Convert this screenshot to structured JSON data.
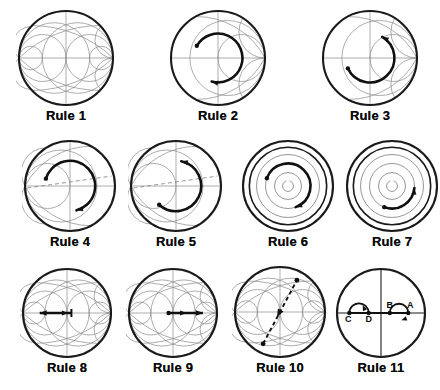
{
  "figure": {
    "background_color": "#ffffff",
    "grid_color": "#8a8a8a",
    "outline_color": "#1a1a1a",
    "arrow_color": "#101010",
    "label_color": "#0a0a0a",
    "rows": 3,
    "columns_per_row": [
      3,
      4,
      4
    ],
    "panel_count": 11
  },
  "panels": [
    {
      "id": "rule-1",
      "label": "Rule 1",
      "chart_type": "immittance-smith-chart",
      "grid": "full-zy",
      "annotation": "none",
      "x": 16,
      "y": 8,
      "size": 100
    },
    {
      "id": "rule-2",
      "label": "Rule 2",
      "chart_type": "smith-chart",
      "grid": "partial-z",
      "annotation": "arc-clockwise",
      "arc_direction": "clockwise",
      "arc_start_deg": 150,
      "arc_end_deg": 255,
      "arc_radius_frac": 0.52,
      "x": 168,
      "y": 8,
      "size": 100
    },
    {
      "id": "rule-3",
      "label": "Rule 3",
      "chart_type": "smith-chart",
      "grid": "partial-z",
      "annotation": "arc-counterclockwise",
      "arc_direction": "counterclockwise",
      "arc_start_deg": 205,
      "arc_end_deg": 60,
      "arc_radius_frac": 0.52,
      "x": 320,
      "y": 8,
      "size": 100
    },
    {
      "id": "rule-4",
      "label": "Rule 4",
      "chart_type": "smith-chart",
      "grid": "partial-y-dashed",
      "annotation": "arc-clockwise",
      "arc_direction": "clockwise",
      "arc_start_deg": 163,
      "arc_end_deg": 285,
      "arc_radius_frac": 0.56,
      "x": 22,
      "y": 138,
      "size": 96
    },
    {
      "id": "rule-5",
      "label": "Rule 5",
      "chart_type": "smith-chart",
      "grid": "partial-y-dashed",
      "annotation": "arc-counterclockwise",
      "arc_direction": "counterclockwise",
      "arc_start_deg": 228,
      "arc_end_deg": 78,
      "arc_radius_frac": 0.56,
      "x": 128,
      "y": 138,
      "size": 96
    },
    {
      "id": "rule-6",
      "label": "Rule 6",
      "chart_type": "constant-vswr-circles",
      "grid": "concentric",
      "annotation": "arc-clockwise",
      "arc_direction": "clockwise",
      "arc_start_deg": 160,
      "arc_end_deg": 290,
      "arc_radius_frac": 0.5,
      "x": 240,
      "y": 138,
      "size": 96
    },
    {
      "id": "rule-7",
      "label": "Rule 7",
      "chart_type": "constant-vswr-circles",
      "grid": "concentric",
      "annotation": "arc-counterclockwise",
      "arc_direction": "counterclockwise",
      "arc_start_deg": 250,
      "arc_end_deg": 355,
      "arc_radius_frac": 0.5,
      "x": 344,
      "y": 138,
      "size": 96
    },
    {
      "id": "rule-8",
      "label": "Rule 8",
      "chart_type": "immittance-smith-chart",
      "grid": "full-zy",
      "annotation": "arrow-left",
      "arrow_direction": "left",
      "arrow_from_frac": 0.1,
      "arrow_to_frac": -0.62,
      "x": 20,
      "y": 266,
      "size": 94
    },
    {
      "id": "rule-9",
      "label": "Rule 9",
      "chart_type": "immittance-smith-chart",
      "grid": "full-zy",
      "annotation": "arrow-right",
      "arrow_direction": "right",
      "arrow_from_frac": -0.1,
      "arrow_to_frac": 0.68,
      "x": 126,
      "y": 266,
      "size": 94
    },
    {
      "id": "rule-10",
      "label": "Rule 10",
      "chart_type": "immittance-smith-chart",
      "grid": "full-zy",
      "annotation": "dashed-diagonal-through-center",
      "diagonal_angle_deg": 62,
      "arrow_direction": "toward-lower-left",
      "x": 232,
      "y": 264,
      "size": 96
    },
    {
      "id": "rule-11",
      "label": "Rule 11",
      "chart_type": "plain-circle-axes",
      "grid": "cross-axes",
      "annotation": "two-labelled-arcs",
      "points": [
        {
          "name": "A",
          "x_frac": 0.62,
          "y_frac": 0.0,
          "label_dx": 2,
          "label_dy": -5
        },
        {
          "name": "B",
          "x_frac": 0.2,
          "y_frac": 0.0,
          "label_dx": 0,
          "label_dy": -5
        },
        {
          "name": "C",
          "x_frac": -0.72,
          "y_frac": 0.0,
          "label_dx": -1,
          "label_dy": 9
        },
        {
          "name": "D",
          "x_frac": -0.28,
          "y_frac": 0.0,
          "label_dx": 0,
          "label_dy": 9
        }
      ],
      "arcs": [
        {
          "from": "D",
          "to": "C",
          "side": "above",
          "direction": "counterclockwise"
        },
        {
          "from": "A",
          "to": "B",
          "side": "below",
          "direction": "clockwise"
        }
      ],
      "x": 334,
      "y": 266,
      "size": 94
    }
  ]
}
